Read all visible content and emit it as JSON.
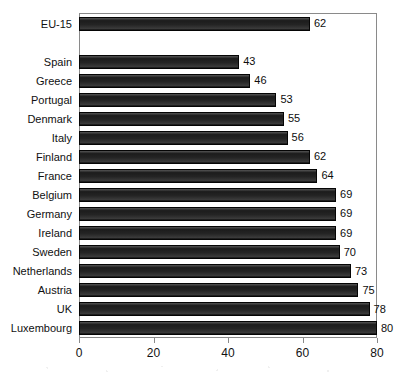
{
  "chart_data": {
    "type": "bar",
    "orientation": "horizontal",
    "title": "",
    "subtitle": "",
    "xlabel": "",
    "ylabel": "",
    "xlim": [
      0,
      80
    ],
    "xticks": [
      0,
      20,
      40,
      60,
      80
    ],
    "xtick_labels": [
      "0",
      "20",
      "40",
      "60",
      "80"
    ],
    "grid": false,
    "legend": false,
    "bar_color": "#2a2a2a",
    "frame_color": "#8a8a8a",
    "background": "#ffffff",
    "categories": [
      "EU-15",
      "",
      "Spain",
      "Greece",
      "Portugal",
      "Denmark",
      "Italy",
      "Finland",
      "France",
      "Belgium",
      "Germany",
      "Ireland",
      "Sweden",
      "Netherlands",
      "Austria",
      "UK",
      "Luxembourg"
    ],
    "values": [
      62,
      null,
      43,
      46,
      53,
      55,
      56,
      62,
      64,
      69,
      69,
      69,
      70,
      73,
      75,
      78,
      80
    ],
    "data_labels": [
      "62",
      "",
      "43",
      "46",
      "53",
      "55",
      "56",
      "62",
      "64",
      "69",
      "69",
      "69",
      "70",
      "73",
      "75",
      "78",
      "80"
    ],
    "rows": [
      {
        "label": "EU-15",
        "value": 62,
        "data_label": "62"
      },
      {
        "label": "",
        "value": null,
        "data_label": ""
      },
      {
        "label": "Spain",
        "value": 43,
        "data_label": "43"
      },
      {
        "label": "Greece",
        "value": 46,
        "data_label": "46"
      },
      {
        "label": "Portugal",
        "value": 53,
        "data_label": "53"
      },
      {
        "label": "Denmark",
        "value": 55,
        "data_label": "55"
      },
      {
        "label": "Italy",
        "value": 56,
        "data_label": "56"
      },
      {
        "label": "Finland",
        "value": 62,
        "data_label": "62"
      },
      {
        "label": "France",
        "value": 64,
        "data_label": "64"
      },
      {
        "label": "Belgium",
        "value": 69,
        "data_label": "69"
      },
      {
        "label": "Germany",
        "value": 69,
        "data_label": "69"
      },
      {
        "label": "Ireland",
        "value": 69,
        "data_label": "69"
      },
      {
        "label": "Sweden",
        "value": 70,
        "data_label": "70"
      },
      {
        "label": "Netherlands",
        "value": 73,
        "data_label": "73"
      },
      {
        "label": "Austria",
        "value": 75,
        "data_label": "75"
      },
      {
        "label": "UK",
        "value": 78,
        "data_label": "78"
      },
      {
        "label": "Luxembourg",
        "value": 80,
        "data_label": "80"
      }
    ]
  }
}
